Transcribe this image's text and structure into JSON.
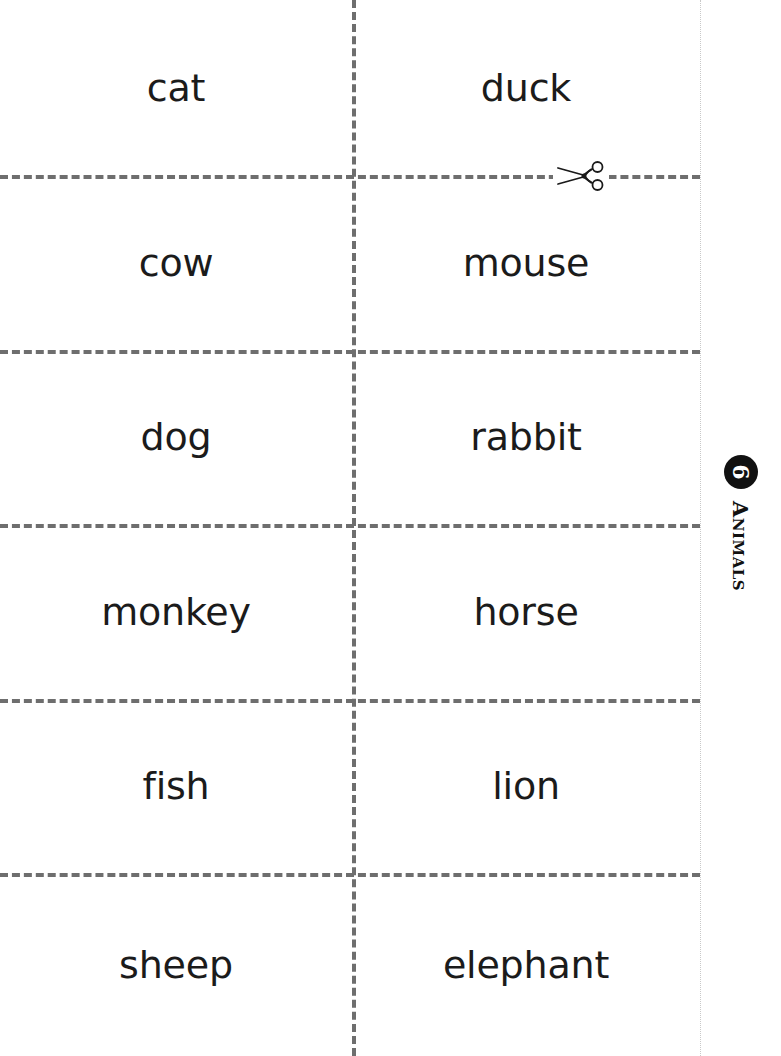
{
  "page": {
    "background_color": "#ffffff",
    "width": 781,
    "height": 1056
  },
  "side_tab": {
    "unit_number": "6",
    "unit_title": "Animals",
    "badge_color": "#111111",
    "badge_text_color": "#ffffff"
  },
  "cut_guide": {
    "line_color": "#6e6e6e",
    "edge_color": "#c9c9c9",
    "scissors_icon": "scissors-icon"
  },
  "cards": {
    "columns": 2,
    "rows": 6,
    "left_column": [
      {
        "word": "cat"
      },
      {
        "word": "cow"
      },
      {
        "word": "dog"
      },
      {
        "word": "monkey"
      },
      {
        "word": "fish"
      },
      {
        "word": "sheep"
      }
    ],
    "right_column": [
      {
        "word": "duck"
      },
      {
        "word": "mouse"
      },
      {
        "word": "rabbit"
      },
      {
        "word": "horse"
      },
      {
        "word": "lion"
      },
      {
        "word": "elephant"
      }
    ]
  }
}
